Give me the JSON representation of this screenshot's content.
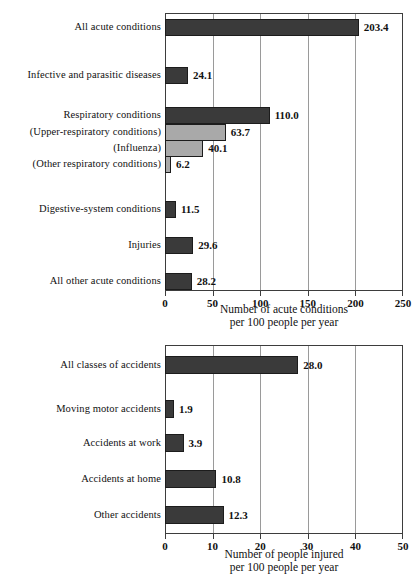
{
  "chart_data": [
    {
      "type": "bar",
      "orientation": "horizontal",
      "title": "",
      "xlabel": "Number of acute conditions per 100 people per year",
      "xlabel_line1": "Number of acute conditions",
      "xlabel_line2": "per 100 people per year",
      "ylabel": "",
      "xlim": [
        0,
        250
      ],
      "xticks": [
        0,
        50,
        100,
        150,
        200,
        250
      ],
      "xtick_labels": [
        "0",
        "50",
        "100",
        "150",
        "200",
        "250"
      ],
      "grid": "vertical",
      "legend": "none",
      "categories": [
        "All acute conditions",
        "Infective and parasitic diseases",
        "Respiratory conditions",
        "(Upper-respiratory conditions)",
        "(Influenza)",
        "(Other respiratory conditions)",
        "Digestive-system conditions",
        "Injuries",
        "All other acute conditions"
      ],
      "values": [
        203.4,
        24.1,
        110.0,
        63.7,
        40.1,
        6.2,
        11.5,
        29.6,
        28.2
      ],
      "value_labels": [
        "203.4",
        "24.1",
        "110.0",
        "63.7",
        "40.1",
        "6.2",
        "11.5",
        "29.6",
        "28.2"
      ],
      "bar_shades": [
        "dark",
        "dark",
        "dark",
        "light",
        "light",
        "light",
        "dark",
        "dark",
        "dark"
      ]
    },
    {
      "type": "bar",
      "orientation": "horizontal",
      "title": "",
      "xlabel": "Number of people injured per 100 people per year",
      "xlabel_line1": "Number of people injured",
      "xlabel_line2": "per 100 people per year",
      "ylabel": "",
      "xlim": [
        0,
        50
      ],
      "xticks": [
        0,
        10,
        20,
        30,
        40,
        50
      ],
      "xtick_labels": [
        "0",
        "10",
        "20",
        "30",
        "40",
        "50"
      ],
      "grid": "vertical",
      "legend": "none",
      "categories": [
        "All classes of accidents",
        "Moving motor accidents",
        "Accidents at work",
        "Accidents at home",
        "Other accidents"
      ],
      "values": [
        28.0,
        1.9,
        3.9,
        10.8,
        12.3
      ],
      "value_labels": [
        "28.0",
        "1.9",
        "3.9",
        "10.8",
        "12.3"
      ],
      "bar_shades": [
        "dark",
        "dark",
        "dark",
        "dark",
        "dark"
      ]
    }
  ],
  "colors": {
    "bar_dark": "#3a3a3a",
    "bar_light": "#a9a9a9",
    "frame": "#3d3d3d",
    "gridline": "#9a9a9a",
    "background": "#ffffff",
    "text": "#111111"
  }
}
